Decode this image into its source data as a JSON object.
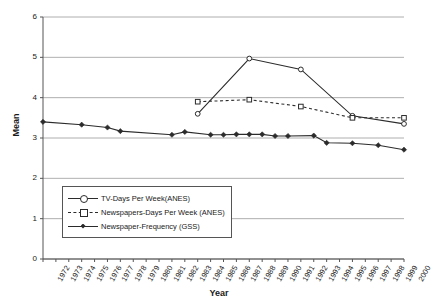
{
  "chart_data": {
    "type": "line",
    "title": "",
    "xlabel": "Year",
    "ylabel": "Mean",
    "ylim": [
      0,
      6
    ],
    "ytick_step": 1,
    "grid": "horizontal",
    "legend_position": "inside-lower-left",
    "categories": [
      "1972",
      "1973",
      "1974",
      "1975",
      "1976",
      "1977",
      "1978",
      "1979",
      "1980",
      "1981",
      "1982",
      "1983",
      "1984",
      "1985",
      "1986",
      "1987",
      "1988",
      "1989",
      "1990",
      "1991",
      "1992",
      "1993",
      "1994",
      "1995",
      "1996",
      "1997",
      "1998",
      "1999",
      "2000"
    ],
    "yticks": [
      "0",
      "1",
      "2",
      "3",
      "4",
      "5",
      "6"
    ],
    "series": [
      {
        "name": "TV-Days Per Week(ANES)",
        "marker": "open-circle",
        "line": "solid",
        "color": "#2b2b2b",
        "points": [
          {
            "x": "1984",
            "y": 3.6
          },
          {
            "x": "1988",
            "y": 4.97
          },
          {
            "x": "1992",
            "y": 4.7
          },
          {
            "x": "1996",
            "y": 3.55
          },
          {
            "x": "2000",
            "y": 3.35
          }
        ]
      },
      {
        "name": "Newspapers-Days Per Week (ANES)",
        "marker": "open-square",
        "line": "dashed",
        "color": "#2b2b2b",
        "points": [
          {
            "x": "1984",
            "y": 3.9
          },
          {
            "x": "1988",
            "y": 3.95
          },
          {
            "x": "1992",
            "y": 3.78
          },
          {
            "x": "1996",
            "y": 3.5
          },
          {
            "x": "2000",
            "y": 3.5
          }
        ]
      },
      {
        "name": "Newspaper-Frequency (GSS)",
        "marker": "solid-diamond",
        "line": "solid",
        "color": "#2b2b2b",
        "points": [
          {
            "x": "1972",
            "y": 3.4
          },
          {
            "x": "1975",
            "y": 3.33
          },
          {
            "x": "1977",
            "y": 3.26
          },
          {
            "x": "1978",
            "y": 3.17
          },
          {
            "x": "1982",
            "y": 3.08
          },
          {
            "x": "1983",
            "y": 3.15
          },
          {
            "x": "1985",
            "y": 3.08
          },
          {
            "x": "1986",
            "y": 3.08
          },
          {
            "x": "1987",
            "y": 3.09
          },
          {
            "x": "1988",
            "y": 3.09
          },
          {
            "x": "1989",
            "y": 3.09
          },
          {
            "x": "1990",
            "y": 3.05
          },
          {
            "x": "1991",
            "y": 3.05
          },
          {
            "x": "1993",
            "y": 3.06
          },
          {
            "x": "1994",
            "y": 2.88
          },
          {
            "x": "1996",
            "y": 2.87
          },
          {
            "x": "1998",
            "y": 2.82
          },
          {
            "x": "2000",
            "y": 2.71
          }
        ]
      }
    ]
  },
  "legend": {
    "items": [
      {
        "label": "TV-Days Per Week(ANES)"
      },
      {
        "label": "Newspapers-Days Per Week (ANES)"
      },
      {
        "label": "Newspaper-Frequency (GSS)"
      }
    ]
  }
}
